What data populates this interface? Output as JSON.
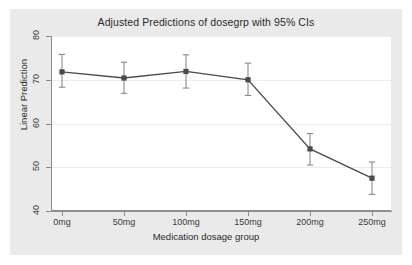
{
  "chart_data": {
    "type": "line",
    "title": "Adjusted Predictions of dosegrp with 95% CIs",
    "xlabel": "Medication dosage group",
    "ylabel": "Linear Prediction",
    "categories": [
      "0mg",
      "50mg",
      "100mg",
      "150mg",
      "200mg",
      "250mg"
    ],
    "values": [
      71.8,
      70.4,
      71.9,
      70.0,
      54.2,
      47.5
    ],
    "ci_lower": [
      68.3,
      66.9,
      68.1,
      66.4,
      50.5,
      43.8
    ],
    "ci_upper": [
      75.8,
      74.0,
      75.7,
      73.8,
      57.7,
      51.2
    ],
    "error_bar_type": "95% confidence interval",
    "ylim": [
      40,
      80
    ],
    "yticks": [
      40,
      50,
      60,
      70,
      80
    ],
    "ytick_labels": [
      "40",
      "50",
      "60",
      "70",
      "80"
    ],
    "xticks": [
      0,
      1,
      2,
      3,
      4,
      5
    ],
    "grid": "horizontal",
    "legend": "none",
    "marker": "square",
    "series_color": "#4a4a4a",
    "plot_background": "#ffffff",
    "graph_background": "#eaeaea",
    "gridline_color": "#ededed",
    "axis_color": "#8e8e8e"
  },
  "axes": {
    "y_tick_labels": [
      "80",
      "70",
      "60",
      "50",
      "40"
    ],
    "x_tick_labels": [
      "0mg",
      "50mg",
      "100mg",
      "150mg",
      "200mg",
      "250mg"
    ]
  }
}
